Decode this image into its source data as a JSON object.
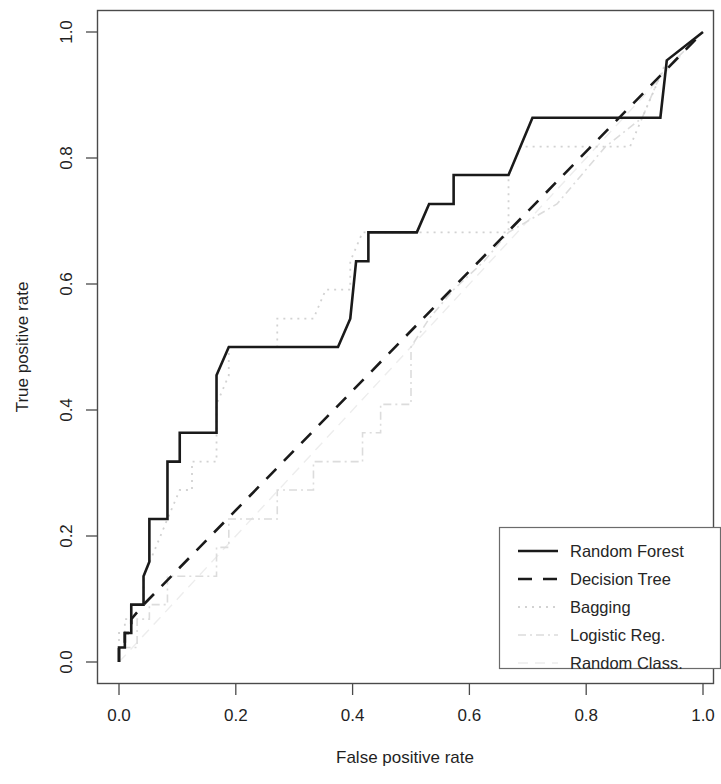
{
  "figure": {
    "background": "#ffffff",
    "frame_color": "#4a4a4a",
    "width": 721,
    "height": 784
  },
  "chart_data": {
    "type": "line",
    "title": "",
    "subtitle": "",
    "xlabel": "False positive rate",
    "ylabel": "True positive rate",
    "xlim": [
      0.0,
      1.0
    ],
    "ylim": [
      0.0,
      1.0
    ],
    "xticks": [
      0.0,
      0.2,
      0.4,
      0.6,
      0.8,
      1.0
    ],
    "yticks": [
      0.0,
      0.2,
      0.4,
      0.6,
      0.8,
      1.0
    ],
    "xtick_labels": [
      "0.0",
      "0.2",
      "0.4",
      "0.6",
      "0.8",
      "1.0"
    ],
    "ytick_labels": [
      "0.0",
      "0.2",
      "0.4",
      "0.6",
      "0.8",
      "1.0"
    ],
    "grid": false,
    "legend_position": "bottom-right",
    "series": [
      {
        "name": "Random Forest",
        "style": "solid",
        "color": "#1a1a1a",
        "width": 2.6,
        "dash": "none",
        "points": [
          [
            0.0,
            0.0
          ],
          [
            0.0,
            0.023
          ],
          [
            0.01,
            0.023
          ],
          [
            0.01,
            0.046
          ],
          [
            0.021,
            0.046
          ],
          [
            0.021,
            0.091
          ],
          [
            0.042,
            0.091
          ],
          [
            0.042,
            0.136
          ],
          [
            0.052,
            0.159
          ],
          [
            0.052,
            0.227
          ],
          [
            0.083,
            0.227
          ],
          [
            0.083,
            0.318
          ],
          [
            0.104,
            0.318
          ],
          [
            0.104,
            0.364
          ],
          [
            0.167,
            0.364
          ],
          [
            0.167,
            0.455
          ],
          [
            0.188,
            0.5
          ],
          [
            0.375,
            0.5
          ],
          [
            0.396,
            0.545
          ],
          [
            0.406,
            0.636
          ],
          [
            0.427,
            0.636
          ],
          [
            0.427,
            0.682
          ],
          [
            0.51,
            0.682
          ],
          [
            0.531,
            0.727
          ],
          [
            0.573,
            0.727
          ],
          [
            0.573,
            0.773
          ],
          [
            0.667,
            0.773
          ],
          [
            0.708,
            0.864
          ],
          [
            0.927,
            0.864
          ],
          [
            0.938,
            0.955
          ],
          [
            1.0,
            1.0
          ]
        ]
      },
      {
        "name": "Decision Tree",
        "style": "dashed",
        "color": "#1a1a1a",
        "width": 2.6,
        "dash": "14 11",
        "points": [
          [
            0.0,
            0.0
          ],
          [
            0.0,
            0.023
          ],
          [
            0.01,
            0.023
          ],
          [
            0.01,
            0.046
          ],
          [
            0.021,
            0.046
          ],
          [
            0.021,
            0.068
          ],
          [
            0.042,
            0.091
          ],
          [
            1.0,
            1.0
          ]
        ]
      },
      {
        "name": "Bagging",
        "style": "dotted",
        "color": "#d2d2d2",
        "width": 1.8,
        "dash": "2 5",
        "points": [
          [
            0.0,
            0.0
          ],
          [
            0.0,
            0.046
          ],
          [
            0.01,
            0.046
          ],
          [
            0.01,
            0.068
          ],
          [
            0.021,
            0.068
          ],
          [
            0.021,
            0.091
          ],
          [
            0.042,
            0.091
          ],
          [
            0.042,
            0.136
          ],
          [
            0.063,
            0.182
          ],
          [
            0.083,
            0.227
          ],
          [
            0.104,
            0.273
          ],
          [
            0.125,
            0.273
          ],
          [
            0.125,
            0.318
          ],
          [
            0.167,
            0.318
          ],
          [
            0.167,
            0.409
          ],
          [
            0.188,
            0.455
          ],
          [
            0.188,
            0.5
          ],
          [
            0.271,
            0.5
          ],
          [
            0.271,
            0.545
          ],
          [
            0.333,
            0.545
          ],
          [
            0.354,
            0.591
          ],
          [
            0.396,
            0.591
          ],
          [
            0.396,
            0.636
          ],
          [
            0.417,
            0.682
          ],
          [
            0.667,
            0.682
          ],
          [
            0.667,
            0.773
          ],
          [
            0.688,
            0.818
          ],
          [
            0.875,
            0.818
          ],
          [
            0.896,
            0.864
          ],
          [
            0.917,
            0.909
          ],
          [
            0.938,
            0.955
          ],
          [
            1.0,
            1.0
          ]
        ]
      },
      {
        "name": "Logistic Reg.",
        "style": "dashdot",
        "color": "#dcdcdc",
        "width": 1.6,
        "dash": "8 4 2 4",
        "points": [
          [
            0.0,
            0.0
          ],
          [
            0.0,
            0.023
          ],
          [
            0.031,
            0.023
          ],
          [
            0.031,
            0.068
          ],
          [
            0.052,
            0.068
          ],
          [
            0.052,
            0.091
          ],
          [
            0.083,
            0.091
          ],
          [
            0.083,
            0.136
          ],
          [
            0.167,
            0.136
          ],
          [
            0.167,
            0.182
          ],
          [
            0.188,
            0.182
          ],
          [
            0.188,
            0.227
          ],
          [
            0.271,
            0.227
          ],
          [
            0.271,
            0.273
          ],
          [
            0.333,
            0.273
          ],
          [
            0.333,
            0.318
          ],
          [
            0.417,
            0.318
          ],
          [
            0.417,
            0.364
          ],
          [
            0.448,
            0.364
          ],
          [
            0.448,
            0.409
          ],
          [
            0.5,
            0.409
          ],
          [
            0.5,
            0.5
          ],
          [
            0.531,
            0.545
          ],
          [
            0.573,
            0.591
          ],
          [
            0.625,
            0.636
          ],
          [
            0.667,
            0.682
          ],
          [
            0.75,
            0.727
          ],
          [
            0.833,
            0.818
          ],
          [
            0.896,
            0.864
          ],
          [
            0.927,
            0.932
          ],
          [
            1.0,
            1.0
          ]
        ]
      },
      {
        "name": "Random Class.",
        "style": "longdash",
        "color": "#ededed",
        "width": 1.4,
        "dash": "10 7",
        "points": [
          [
            0.0,
            0.0
          ],
          [
            1.0,
            1.0
          ]
        ]
      }
    ]
  },
  "legend": {
    "entries": [
      {
        "label": "Random Forest"
      },
      {
        "label": "Decision Tree"
      },
      {
        "label": "Bagging"
      },
      {
        "label": "Logistic Reg."
      },
      {
        "label": "Random Class."
      }
    ]
  }
}
